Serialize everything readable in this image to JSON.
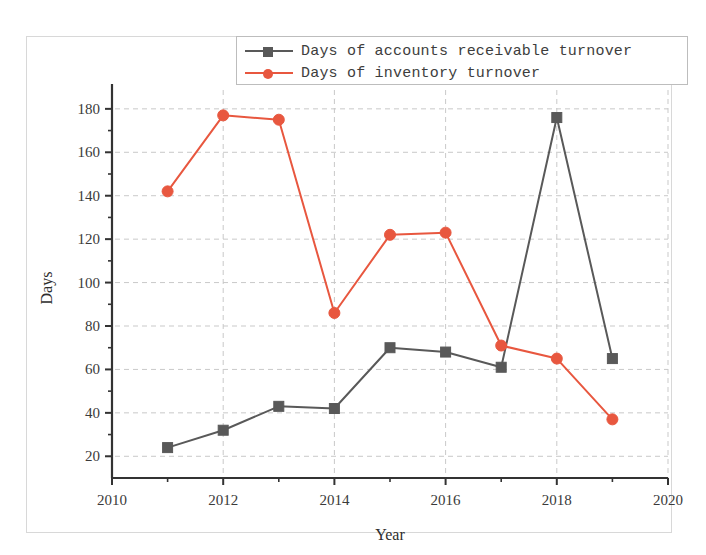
{
  "chart_data": {
    "type": "line",
    "title": "",
    "xlabel": "Year",
    "ylabel": "Days",
    "x": [
      2011,
      2012,
      2013,
      2014,
      2015,
      2016,
      2017,
      2018,
      2019
    ],
    "xlim": [
      2010,
      2020
    ],
    "ylim": [
      10,
      185
    ],
    "xticks": [
      2010,
      2012,
      2014,
      2016,
      2018,
      2020
    ],
    "xtick_labels": [
      "2010",
      "2012",
      "2014",
      "2016",
      "2018",
      "2020"
    ],
    "x_minor_ticks": [
      2011,
      2013,
      2015,
      2017,
      2019
    ],
    "yticks": [
      20,
      40,
      60,
      80,
      100,
      120,
      140,
      160,
      180
    ],
    "ytick_labels": [
      "20",
      "40",
      "60",
      "80",
      "100",
      "120",
      "140",
      "160",
      "180"
    ],
    "y_minor_ticks": [
      30,
      50,
      70,
      90,
      110,
      130,
      150,
      170
    ],
    "grid": true,
    "grid_style": "dashed",
    "grid_color": "#c9c9c9",
    "legend_position": "top-right",
    "series": [
      {
        "name": "Days of accounts receivable turnover",
        "color": "#595959",
        "marker": "square",
        "values": [
          24,
          32,
          43,
          42,
          70,
          68,
          61,
          176,
          65
        ]
      },
      {
        "name": "Days of inventory turnover",
        "color": "#e8573f",
        "marker": "circle",
        "values": [
          142,
          177,
          175,
          86,
          122,
          123,
          71,
          65,
          37
        ]
      }
    ]
  },
  "legend": {
    "items": [
      {
        "label": "Days of accounts receivable turnover",
        "color": "#595959",
        "marker": "square"
      },
      {
        "label": "Days of inventory turnover",
        "color": "#e8573f",
        "marker": "circle"
      }
    ]
  },
  "axes": {
    "x_title": "Year",
    "y_title": "Days"
  }
}
